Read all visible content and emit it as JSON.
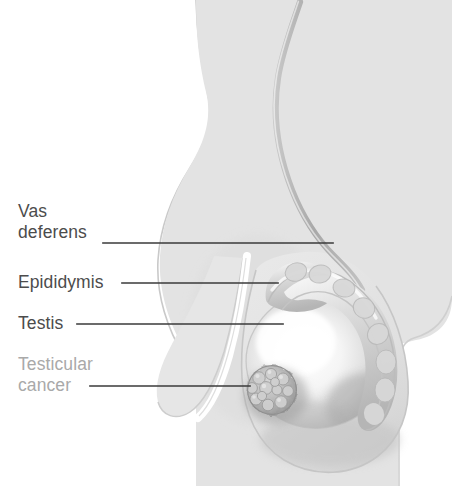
{
  "figure": {
    "style": "grayscale medical line-and-wash illustration",
    "background_color": "#ffffff",
    "body_silhouette_color": "#e3e3e3",
    "outline_color": "#c9c9c9",
    "leader_line_color": "#3a3a3a",
    "label_color": "#4c4c4c",
    "muted_label_color": "#a9a9a9",
    "tumor_color": "#b4b4b4",
    "testis_highlight_color": "#ffffff",
    "epididymis_color": "#d4d4d4"
  },
  "labels": [
    {
      "id": "vas-deferens",
      "name": "Vas deferens",
      "line1": "Vas",
      "line2": "deferens",
      "muted": false,
      "leader": {
        "x1": 103,
        "y1": 243,
        "x2": 333,
        "y2": 243
      }
    },
    {
      "id": "epididymis",
      "name": "Epididymis",
      "line1": "Epididymis",
      "line2": "",
      "muted": false,
      "leader": {
        "x1": 122,
        "y1": 283,
        "x2": 278,
        "y2": 283
      }
    },
    {
      "id": "testis",
      "name": "Testis",
      "line1": "Testis",
      "line2": "",
      "muted": false,
      "leader": {
        "x1": 77,
        "y1": 324,
        "x2": 283,
        "y2": 324
      }
    },
    {
      "id": "testicular-cancer",
      "name": "Testicular cancer",
      "line1": "Testicular",
      "line2": "cancer",
      "muted": true,
      "leader": {
        "x1": 90,
        "y1": 386,
        "x2": 250,
        "y2": 386
      }
    }
  ],
  "structures": [
    {
      "id": "body-silhouette",
      "name": "Lower abdomen and groin silhouette"
    },
    {
      "id": "penis-shaft",
      "name": "Penis shaft"
    },
    {
      "id": "scrotum",
      "name": "Scrotum"
    },
    {
      "id": "vas-deferens-tube",
      "name": "Vas deferens tube"
    },
    {
      "id": "epididymis-body",
      "name": "Epididymis"
    },
    {
      "id": "testis-body",
      "name": "Testis"
    },
    {
      "id": "tumor-mass",
      "name": "Testicular cancer tumor mass"
    }
  ]
}
